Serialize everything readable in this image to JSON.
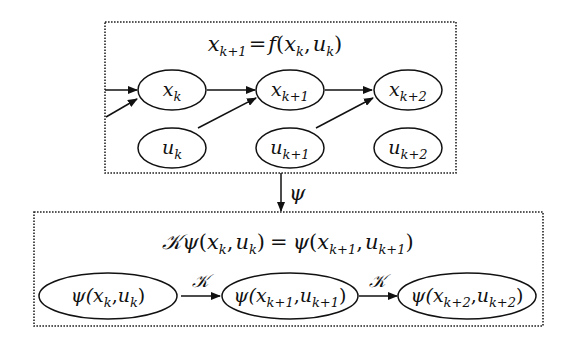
{
  "diagram": {
    "top_box": {
      "equation": {
        "lhs_var": "x",
        "lhs_sub": "k+1",
        "eq": "=",
        "fn": "f",
        "open": "(",
        "a_var": "x",
        "a_sub": "k",
        "comma": ",",
        "b_var": "u",
        "b_sub": "k",
        "close": ")"
      },
      "state_nodes": [
        {
          "var": "x",
          "sub": "k"
        },
        {
          "var": "x",
          "sub": "k+1"
        },
        {
          "var": "x",
          "sub": "k+2"
        }
      ],
      "input_nodes": [
        {
          "var": "u",
          "sub": "k"
        },
        {
          "var": "u",
          "sub": "k+1"
        },
        {
          "var": "u",
          "sub": "k+2"
        }
      ]
    },
    "mapping": {
      "label": "ψ"
    },
    "bottom_box": {
      "equation": {
        "op": "𝒦",
        "psi": "ψ",
        "open": "(",
        "a_var": "x",
        "a_sub": "k",
        "comma": ",",
        "b_var": "u",
        "b_sub": "k",
        "close": ")",
        "eq": "=",
        "psi2": "ψ",
        "open2": "(",
        "c_var": "x",
        "c_sub": "k+1",
        "comma2": ",",
        "d_var": "u",
        "d_sub": "k+1",
        "close2": ")"
      },
      "lifted_nodes": [
        {
          "psi": "ψ(",
          "x": "x",
          "xs": "k",
          "comma": ",",
          "u": "u",
          "us": "k",
          "close": ")"
        },
        {
          "psi": "ψ(",
          "x": "x",
          "xs": "k+1",
          "comma": ",",
          "u": "u",
          "us": "k+1",
          "close": ")"
        },
        {
          "psi": "ψ(",
          "x": "x",
          "xs": "k+2",
          "comma": ",",
          "u": "u",
          "us": "k+2",
          "close": ")"
        }
      ],
      "operator_labels": [
        "𝒦",
        "𝒦"
      ]
    }
  }
}
